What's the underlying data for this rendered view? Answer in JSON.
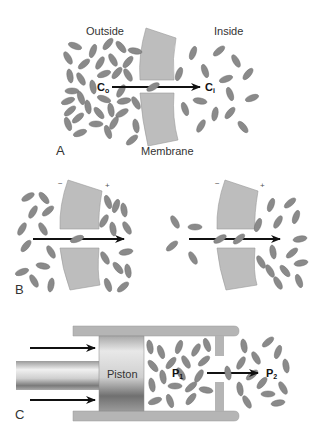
{
  "panel_a": {
    "letter": "A",
    "outside_label": "Outside",
    "inside_label": "Inside",
    "membrane_label": "Membrane",
    "c_outside": "C",
    "c_outside_sub": "o",
    "c_inside": "C",
    "c_inside_sub": "i"
  },
  "panel_b": {
    "letter": "B",
    "left_minus": "−",
    "left_plus": "+",
    "right_minus": "−",
    "right_plus": "+"
  },
  "panel_c": {
    "letter": "C",
    "piston_label": "Piston",
    "p1": "P",
    "p1_sub": "1",
    "p2": "P",
    "p2_sub": "2"
  },
  "colors": {
    "molecule": "#8a8a8a",
    "membrane": "#bdbdbd",
    "arrow": "#111111"
  }
}
